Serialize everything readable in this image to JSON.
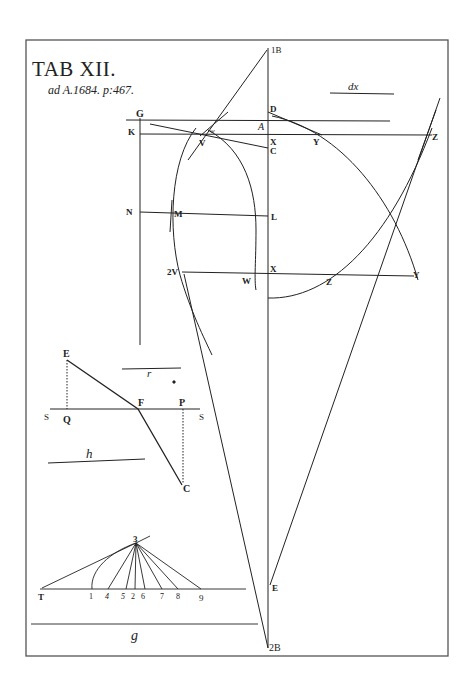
{
  "plate": {
    "title": "TAB XII.",
    "subtitle": "ad A.1684. p:467.",
    "frame_color": "#555555",
    "ink_color": "#222222"
  },
  "main_figure": {
    "labels": {
      "B_top": "1B",
      "B_bottom": "2B",
      "G": "G",
      "K": "K",
      "D": "D",
      "A": "A",
      "X1": "X",
      "C": "C",
      "Y1": "Y",
      "Z1": "Z",
      "V1": "V",
      "w": "w",
      "N": "N",
      "M": "M",
      "L": "L",
      "V2": "2V",
      "W": "W",
      "X2": "X",
      "Z2": "Z",
      "Y2": "Y",
      "E": "E"
    },
    "scale_label": "dx"
  },
  "refraction_figure": {
    "labels": {
      "E": "E",
      "F": "F",
      "P": "P",
      "Q": "Q",
      "S_left": "S",
      "S_right": "S",
      "C": "C"
    },
    "scale_r": "r",
    "scale_h": "h"
  },
  "fan_figure": {
    "apex": "3",
    "base_labels": [
      "T",
      "1",
      "4",
      "5",
      "2",
      "6",
      "7",
      "8",
      "9"
    ],
    "scale_g": "g"
  }
}
